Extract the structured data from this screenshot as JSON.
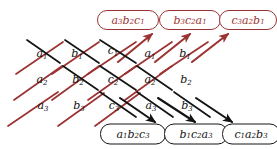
{
  "figure": {
    "colors": {
      "positive_red": "#9c3333",
      "negative_black": "#141414",
      "background": "#ffffff"
    }
  },
  "grid": {
    "rows": [
      {
        "row_index": 1,
        "cells": [
          {
            "base": "a",
            "sub": "1",
            "x": 42,
            "y": 53
          },
          {
            "base": "b",
            "sub": "1",
            "x": 77,
            "y": 53
          },
          {
            "base": "c",
            "sub": "1",
            "x": 113,
            "y": 50
          },
          {
            "base": "a",
            "sub": "1",
            "x": 150,
            "y": 53
          },
          {
            "base": "b",
            "sub": "1",
            "x": 185,
            "y": 53
          }
        ]
      },
      {
        "row_index": 2,
        "cells": [
          {
            "base": "a",
            "sub": "2",
            "x": 42,
            "y": 79
          },
          {
            "base": "b",
            "sub": "2",
            "x": 78,
            "y": 79
          },
          {
            "base": "c",
            "sub": "2",
            "x": 113,
            "y": 79
          },
          {
            "base": "a",
            "sub": "2",
            "x": 150,
            "y": 79
          },
          {
            "base": "b",
            "sub": "2",
            "x": 186,
            "y": 79
          }
        ]
      },
      {
        "row_index": 3,
        "cells": [
          {
            "base": "a",
            "sub": "3",
            "x": 43,
            "y": 105
          },
          {
            "base": "b",
            "sub": "3",
            "x": 79,
            "y": 105
          },
          {
            "base": "c",
            "sub": "3",
            "x": 114,
            "y": 105
          },
          {
            "base": "a",
            "sub": "3",
            "x": 151,
            "y": 105
          },
          {
            "base": "b",
            "sub": "3",
            "x": 187,
            "y": 105
          }
        ]
      }
    ]
  },
  "products": {
    "upward_red": [
      {
        "terms": [
          [
            "a",
            "3"
          ],
          [
            "b",
            "2"
          ],
          [
            "c",
            "1"
          ]
        ],
        "cx": 128,
        "cy": 20,
        "w": 62,
        "h": 20
      },
      {
        "terms": [
          [
            "b",
            "3"
          ],
          [
            "c",
            "2"
          ],
          [
            "a",
            "1"
          ]
        ],
        "cx": 190,
        "cy": 20,
        "w": 62,
        "h": 20
      },
      {
        "terms": [
          [
            "c",
            "3"
          ],
          [
            "a",
            "2"
          ],
          [
            "b",
            "1"
          ]
        ],
        "cx": 248,
        "cy": 20,
        "w": 58,
        "h": 20
      }
    ],
    "downward_black": [
      {
        "terms": [
          [
            "a",
            "1"
          ],
          [
            "b",
            "2"
          ],
          [
            "c",
            "3"
          ]
        ],
        "cx": 133,
        "cy": 134,
        "w": 66,
        "h": 21
      },
      {
        "terms": [
          [
            "b",
            "1"
          ],
          [
            "c",
            "2"
          ],
          [
            "a",
            "3"
          ]
        ],
        "cx": 196,
        "cy": 134,
        "w": 64,
        "h": 21
      },
      {
        "terms": [
          [
            "c",
            "1"
          ],
          [
            "a",
            "2"
          ],
          [
            "b",
            "3"
          ]
        ],
        "cx": 251,
        "cy": 134,
        "w": 58,
        "h": 21
      }
    ]
  },
  "lines": {
    "red_diagonals": [
      {
        "x1": 8,
        "y1": 126,
        "x2": 58,
        "y2": 92,
        "arrow": false
      },
      {
        "x1": 14,
        "y1": 100,
        "x2": 62,
        "y2": 66,
        "arrow": false
      },
      {
        "x1": 16,
        "y1": 74,
        "x2": 63,
        "y2": 42,
        "arrow": false
      },
      {
        "x1": 58,
        "y1": 126,
        "x2": 104,
        "y2": 93,
        "arrow": false
      },
      {
        "x1": 52,
        "y1": 100,
        "x2": 99,
        "y2": 66,
        "arrow": false
      },
      {
        "x1": 95,
        "y1": 126,
        "x2": 140,
        "y2": 93,
        "arrow": false
      },
      {
        "x1": 52,
        "y1": 74,
        "x2": 99,
        "y2": 42,
        "arrow": false
      },
      {
        "x1": 88,
        "y1": 100,
        "x2": 136,
        "y2": 66,
        "arrow": false
      },
      {
        "x1": 88,
        "y1": 74,
        "x2": 136,
        "y2": 42,
        "arrow": false
      },
      {
        "x1": 125,
        "y1": 100,
        "x2": 172,
        "y2": 66,
        "arrow": false
      },
      {
        "x1": 125,
        "y1": 74,
        "x2": 172,
        "y2": 42,
        "arrow": false
      },
      {
        "x1": 160,
        "y1": 74,
        "x2": 208,
        "y2": 42,
        "arrow": false
      },
      {
        "x1": 118,
        "y1": 62,
        "x2": 152,
        "y2": 34,
        "arrow": true
      },
      {
        "x1": 155,
        "y1": 62,
        "x2": 190,
        "y2": 34,
        "arrow": true
      },
      {
        "x1": 192,
        "y1": 62,
        "x2": 228,
        "y2": 34,
        "arrow": true
      }
    ],
    "black_diagonals": [
      {
        "x1": 27,
        "y1": 40,
        "x2": 60,
        "y2": 63,
        "arrow": false
      },
      {
        "x1": 65,
        "y1": 40,
        "x2": 99,
        "y2": 63,
        "arrow": false
      },
      {
        "x1": 100,
        "y1": 40,
        "x2": 136,
        "y2": 63,
        "arrow": false
      },
      {
        "x1": 63,
        "y1": 66,
        "x2": 98,
        "y2": 90,
        "arrow": false
      },
      {
        "x1": 100,
        "y1": 66,
        "x2": 136,
        "y2": 90,
        "arrow": false
      },
      {
        "x1": 137,
        "y1": 66,
        "x2": 172,
        "y2": 90,
        "arrow": false
      },
      {
        "x1": 100,
        "y1": 92,
        "x2": 136,
        "y2": 117,
        "arrow": false
      },
      {
        "x1": 137,
        "y1": 92,
        "x2": 173,
        "y2": 117,
        "arrow": false
      },
      {
        "x1": 174,
        "y1": 92,
        "x2": 210,
        "y2": 117,
        "arrow": false
      },
      {
        "x1": 120,
        "y1": 98,
        "x2": 155,
        "y2": 122,
        "arrow": true
      },
      {
        "x1": 158,
        "y1": 98,
        "x2": 195,
        "y2": 122,
        "arrow": true
      },
      {
        "x1": 196,
        "y1": 98,
        "x2": 232,
        "y2": 122,
        "arrow": true
      }
    ]
  }
}
